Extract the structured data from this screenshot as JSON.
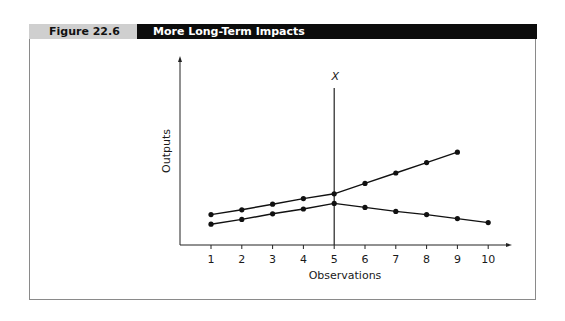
{
  "figure": {
    "label": "Figure 22.6",
    "title": "More Long-Term Impacts"
  },
  "chart_data": {
    "type": "line",
    "title": "More Long-Term Impacts",
    "xlabel": "Observations",
    "ylabel": "Outputs",
    "x": [
      1,
      2,
      3,
      4,
      5,
      6,
      7,
      8,
      9,
      10
    ],
    "tick_labels": [
      "1",
      "2",
      "3",
      "4",
      "5",
      "6",
      "7",
      "8",
      "9",
      "10"
    ],
    "series": [
      {
        "name": "upper",
        "x": [
          1,
          2,
          3,
          4,
          5,
          6,
          7,
          8,
          9
        ],
        "values": [
          3.8,
          4.4,
          5.1,
          5.8,
          6.4,
          7.7,
          9.0,
          10.3,
          11.6
        ]
      },
      {
        "name": "lower",
        "x": [
          1,
          2,
          3,
          4,
          5,
          6,
          7,
          8,
          9,
          10
        ],
        "values": [
          2.6,
          3.2,
          3.9,
          4.5,
          5.2,
          4.7,
          4.2,
          3.8,
          3.3,
          2.8
        ]
      }
    ],
    "annotations": [
      {
        "type": "vertical_line",
        "x": 5,
        "label": "X"
      }
    ],
    "grid": false,
    "legend": "none",
    "ylim": [
      0,
      14.5
    ],
    "xlim": [
      0,
      11
    ]
  }
}
